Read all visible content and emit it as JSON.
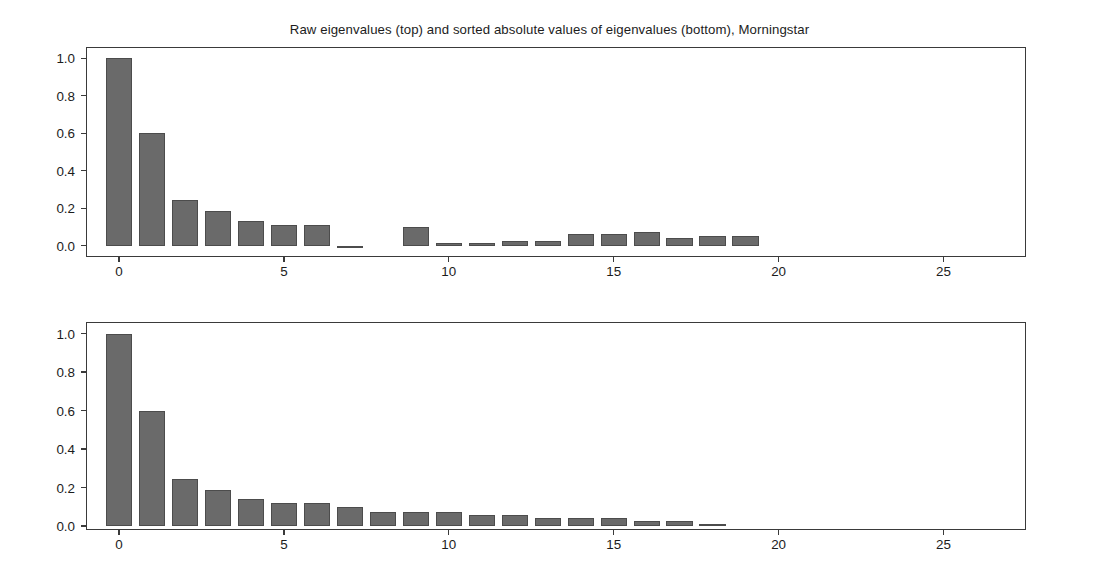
{
  "figure": {
    "title": "Raw eigenvalues (top) and sorted absolute values of eigenvalues (bottom), Morningstar",
    "bar_color": "#6a6a6a",
    "bar_edge_color": "#4c4c4c",
    "axis_color": "#3a3a3a",
    "background": "#ffffff"
  },
  "chart_data": [
    {
      "type": "bar",
      "panel": "top",
      "title": "Raw eigenvalues (top) and sorted absolute values of eigenvalues (bottom), Morningstar",
      "subtitle": "Raw eigenvalues",
      "xlabel": "",
      "ylabel": "",
      "grid": false,
      "legend": "none",
      "xlim": [
        -1.0,
        27.5
      ],
      "ylim": [
        -0.06,
        1.06
      ],
      "xticks": [
        0,
        5,
        10,
        15,
        20,
        25
      ],
      "xtick_labels": [
        "0",
        "5",
        "10",
        "15",
        "20",
        "25"
      ],
      "yticks": [
        0.0,
        0.2,
        0.4,
        0.6,
        0.8,
        1.0
      ],
      "ytick_labels": [
        "0.0",
        "0.2",
        "0.4",
        "0.6",
        "0.8",
        "1.0"
      ],
      "x": [
        0,
        1,
        2,
        3,
        4,
        5,
        6,
        7,
        8,
        9,
        10,
        11,
        12,
        13,
        14,
        15,
        16,
        17,
        18,
        19
      ],
      "values": [
        1.0,
        0.6,
        0.245,
        0.185,
        0.132,
        0.112,
        0.112,
        -0.012,
        0.0,
        0.1,
        0.013,
        0.016,
        0.027,
        0.023,
        0.062,
        0.062,
        0.072,
        0.04,
        0.05,
        0.052
      ]
    },
    {
      "type": "bar",
      "panel": "bottom",
      "subtitle": "Sorted absolute values of eigenvalues",
      "xlabel": "",
      "ylabel": "",
      "grid": false,
      "legend": "none",
      "xlim": [
        -1.0,
        27.5
      ],
      "ylim": [
        -0.02,
        1.06
      ],
      "xticks": [
        0,
        5,
        10,
        15,
        20,
        25
      ],
      "xtick_labels": [
        "0",
        "5",
        "10",
        "15",
        "20",
        "25"
      ],
      "yticks": [
        0.0,
        0.2,
        0.4,
        0.6,
        0.8,
        1.0
      ],
      "ytick_labels": [
        "0.0",
        "0.2",
        "0.4",
        "0.6",
        "0.8",
        "1.0"
      ],
      "x": [
        0,
        1,
        2,
        3,
        4,
        5,
        6,
        7,
        8,
        9,
        10,
        11,
        12,
        13,
        14,
        15,
        16,
        17,
        18
      ],
      "values": [
        1.0,
        0.6,
        0.245,
        0.19,
        0.14,
        0.122,
        0.122,
        0.1,
        0.075,
        0.072,
        0.072,
        0.06,
        0.056,
        0.04,
        0.04,
        0.04,
        0.026,
        0.026,
        0.01
      ]
    }
  ]
}
